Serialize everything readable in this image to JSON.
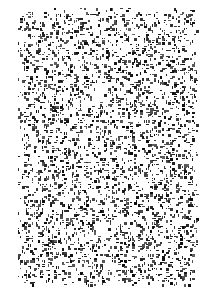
{
  "image": {
    "description": "random black speckle noise texture on white background",
    "width": 214,
    "height": 297,
    "background_color": "#ffffff",
    "speck_color": "#1a1a1a",
    "region": {
      "x0": 18,
      "y0": 8,
      "x1": 198,
      "y1": 286
    },
    "density": 0.24
  }
}
